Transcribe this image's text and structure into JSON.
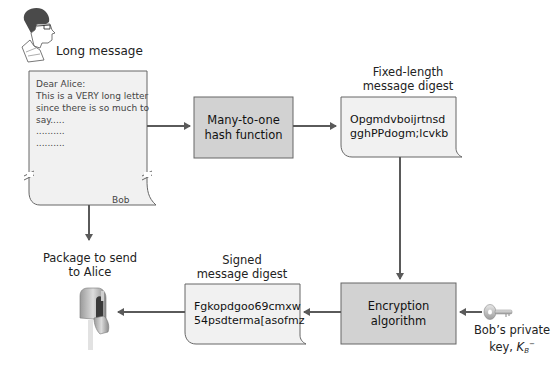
{
  "colors": {
    "process_box_fill": "#d2d2d2",
    "document_fill": "#f1f1f1",
    "stroke": "#555555",
    "arrow": "#5a5a5a"
  },
  "sender": {
    "icon": "person-head-icon",
    "label": "Long message"
  },
  "letter": {
    "lines": [
      "Dear Alice:",
      "This is a VERY long letter",
      "since there is so much to",
      "say.....",
      "..........",
      ".........."
    ],
    "signature": "Bob"
  },
  "hash_box": {
    "line1": "Many-to-one",
    "line2": "hash function"
  },
  "digest": {
    "title_line1": "Fixed-length",
    "title_line2": "message digest",
    "line1": "Opgmdvboijrtnsd",
    "line2": "gghPPdogm;lcvkb"
  },
  "encryption_box": {
    "line1": "Encryption",
    "line2": "algorithm"
  },
  "private_key": {
    "icon": "key-icon",
    "line1": "Bob’s private",
    "line2_prefix": "key, ",
    "key_symbol": "K",
    "key_subscript": "B",
    "key_superscript": "−"
  },
  "signed_digest": {
    "title_line1": "Signed",
    "title_line2": "message digest",
    "line1": "Fgkopdgoo69cmxw",
    "line2": "54psdterma[asofmz"
  },
  "package": {
    "line1": "Package to send",
    "line2": "to Alice",
    "icon": "mailbox-icon"
  }
}
